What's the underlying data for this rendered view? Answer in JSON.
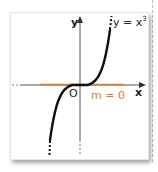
{
  "figure": {
    "axis_x_label": "x",
    "axis_y_label": "y",
    "origin_label": "O",
    "curve_label": "y = x",
    "curve_exponent": "3",
    "tangent_label": "m = 0",
    "colors": {
      "curve": "#111111",
      "axes": "#555555",
      "tangent": "#e8782f",
      "panel": "#ffffff"
    }
  }
}
